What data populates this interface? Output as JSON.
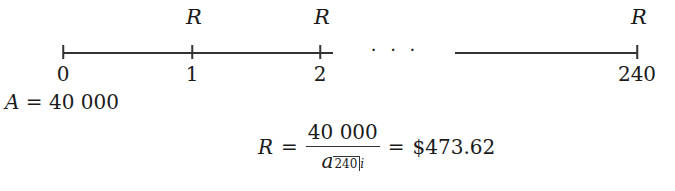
{
  "timeline": {
    "payment_label": "R",
    "payments_at": [
      "1",
      "2",
      "240"
    ],
    "ticks": [
      {
        "label": "0",
        "x": 63
      },
      {
        "label": "1",
        "x": 192
      },
      {
        "label": "2",
        "x": 320
      },
      {
        "label": "240",
        "x": 637
      }
    ],
    "ellipsis": "· · ·"
  },
  "present_value": {
    "symbol": "A",
    "equals": "=",
    "value": "40 000"
  },
  "formula": {
    "lhs": "R",
    "equals": "=",
    "numerator": "40 000",
    "denominator_symbol": "a",
    "denominator_n": "240",
    "denominator_i": "i",
    "equals2": "=",
    "result": "$473.62"
  }
}
